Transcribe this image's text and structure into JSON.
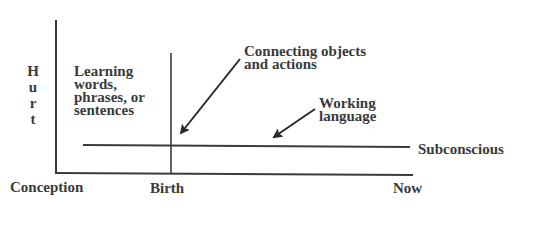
{
  "diagram": {
    "y_axis_label_letters": [
      "H",
      "u",
      "r",
      "t"
    ],
    "x_axis_labels": {
      "start": "Conception",
      "middle": "Birth",
      "end": "Now"
    },
    "region_label_lines": [
      "Learning",
      "words,",
      "phrases, or",
      "sentences"
    ],
    "annotations": {
      "connecting": {
        "lines": [
          "Connecting objects",
          "and actions"
        ]
      },
      "working": {
        "lines": [
          "Working",
          "language"
        ]
      }
    },
    "threshold_line_label": "Subconscious",
    "colors": {
      "ink": "#3a3a3a",
      "background": "#ffffff"
    }
  }
}
